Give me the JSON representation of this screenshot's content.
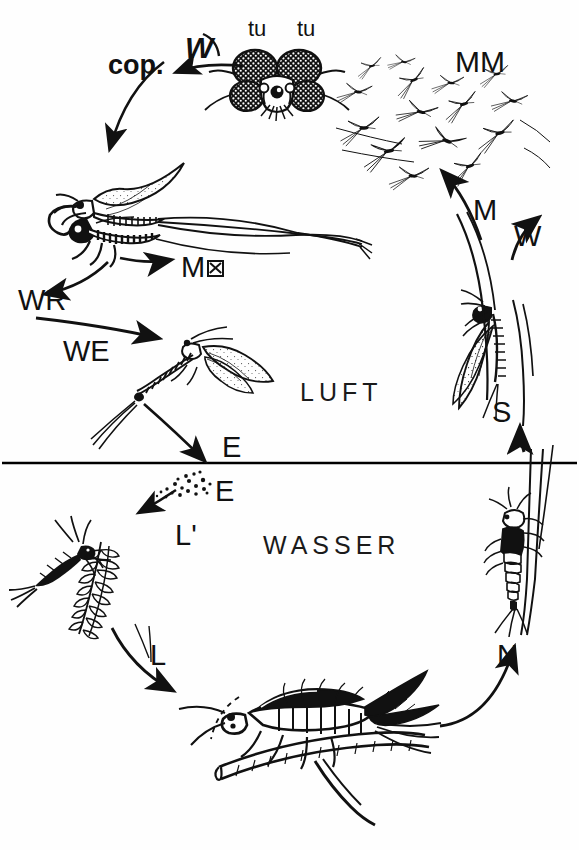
{
  "diagram": {
    "zones": [
      {
        "key": "air",
        "label": "LUFT",
        "x": 300,
        "y": 378,
        "size": 25
      },
      {
        "key": "water",
        "label": "WASSER",
        "x": 263,
        "y": 531,
        "size": 25
      }
    ],
    "waterline_y": 463,
    "labels": [
      {
        "name": "copula-label",
        "text": "cop.",
        "x": 108,
        "y": 52,
        "size": 27
      },
      {
        "name": "female-arrival-label",
        "text": "W",
        "x": 185,
        "y": 33,
        "size": 30,
        "italic": true
      },
      {
        "name": "turban-eye-left",
        "text": "tu",
        "x": 248,
        "y": 18,
        "size": 22
      },
      {
        "name": "turban-eye-right",
        "text": "tu",
        "x": 297,
        "y": 18,
        "size": 22
      },
      {
        "name": "male-swarm-label",
        "text": "MM",
        "x": 455,
        "y": 47,
        "size": 30
      },
      {
        "name": "male-ascend-label",
        "text": "M",
        "x": 473,
        "y": 196,
        "size": 29
      },
      {
        "name": "female-ascend-label",
        "text": "W",
        "x": 514,
        "y": 222,
        "size": 29
      },
      {
        "name": "male-death-label",
        "text": "M",
        "x": 181,
        "y": 253,
        "size": 29,
        "dead": true
      },
      {
        "name": "female-return-label",
        "text": "WR",
        "x": 18,
        "y": 286,
        "size": 29
      },
      {
        "name": "female-eggs-label",
        "text": "WE",
        "x": 63,
        "y": 337,
        "size": 29
      },
      {
        "name": "eggs-air-label",
        "text": "E",
        "x": 222,
        "y": 433,
        "size": 29
      },
      {
        "name": "eggs-water-label",
        "text": "E",
        "x": 215,
        "y": 477,
        "size": 29
      },
      {
        "name": "young-larva-label",
        "text": "L'",
        "x": 175,
        "y": 521,
        "size": 29
      },
      {
        "name": "larva-label",
        "text": "L",
        "x": 150,
        "y": 641,
        "size": 29
      },
      {
        "name": "nymph-label",
        "text": "N",
        "x": 497,
        "y": 641,
        "size": 29
      },
      {
        "name": "emergence-label",
        "text": "S",
        "x": 492,
        "y": 398,
        "size": 29
      }
    ],
    "stages": [
      {
        "key": "copula",
        "name": "mating-pair-imago",
        "caption": "cop."
      },
      {
        "key": "head",
        "name": "male-head-turban-eyes",
        "caption": "tu"
      },
      {
        "key": "swarm",
        "name": "male-swarm",
        "caption": "MM"
      },
      {
        "key": "subimago",
        "name": "subimago-on-stem",
        "caption": "S"
      },
      {
        "key": "egglaying",
        "name": "egg-laying-female",
        "caption": "WE"
      },
      {
        "key": "eggs",
        "name": "egg-cluster",
        "caption": "E"
      },
      {
        "key": "young-larva",
        "name": "young-larva",
        "caption": "L'"
      },
      {
        "key": "larva",
        "name": "mature-larva-on-twig",
        "caption": "L"
      },
      {
        "key": "nymph",
        "name": "emerging-nymph",
        "caption": "N"
      }
    ],
    "colors": {
      "ink": "#111111",
      "background": "#ffffff",
      "waterline": "#000000"
    }
  }
}
